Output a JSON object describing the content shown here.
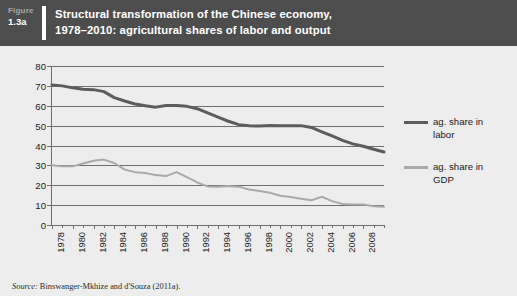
{
  "figure": {
    "label_word": "Figure",
    "label_number": "1.3a",
    "title_line1": "Structural transformation of the Chinese economy,",
    "title_line2": "1978–2010: agricultural shares of labor and output",
    "title_bar_color": "#4d4d4d",
    "panel_color": "#ededed"
  },
  "source": {
    "prefix": "Source:",
    "text": "Binswanger-Mkhize and d'Souza (2011a)."
  },
  "legend": {
    "position": "right",
    "items": [
      {
        "label_line1": "ag. share in",
        "label_line2": "labor",
        "color": "#5c5c5c"
      },
      {
        "label_line1": "ag. share in",
        "label_line2": "GDP",
        "color": "#a9a9a9"
      }
    ]
  },
  "chart_data": {
    "type": "line",
    "title": "Structural transformation of the Chinese economy, 1978–2010: agricultural shares of labor and output",
    "xlabel": "",
    "ylabel": "",
    "ylim": [
      0,
      80
    ],
    "yticks": [
      0,
      10,
      20,
      30,
      40,
      50,
      60,
      70,
      80
    ],
    "ytick_labels": [
      "0",
      "10",
      "20",
      "30",
      "40",
      "50",
      "60",
      "70",
      "80"
    ],
    "xlim": [
      1978,
      2010
    ],
    "xticks": [
      1978,
      1980,
      1982,
      1984,
      1986,
      1988,
      1990,
      1992,
      1994,
      1996,
      1998,
      2000,
      2002,
      2004,
      2006,
      2008
    ],
    "xtick_labels": [
      "1978",
      "1980",
      "1982",
      "1984",
      "1986",
      "1988",
      "1990",
      "1992",
      "1994",
      "1996",
      "1998",
      "2000",
      "2002",
      "2004",
      "2006",
      "2008"
    ],
    "xtick_labels_rotated": true,
    "grid": "horizontal",
    "legend_position": "right",
    "x": [
      1978,
      1979,
      1980,
      1981,
      1982,
      1983,
      1984,
      1985,
      1986,
      1987,
      1988,
      1989,
      1990,
      1991,
      1992,
      1993,
      1994,
      1995,
      1996,
      1997,
      1998,
      1999,
      2000,
      2001,
      2002,
      2003,
      2004,
      2005,
      2006,
      2007,
      2008,
      2009,
      2010
    ],
    "series": [
      {
        "name": "ag. share in labor",
        "color": "#5c5c5c",
        "values": [
          70.5,
          70.0,
          69.0,
          68.3,
          68.1,
          67.1,
          64.1,
          62.4,
          60.9,
          60.0,
          59.3,
          60.1,
          60.1,
          59.7,
          58.5,
          56.4,
          54.3,
          52.2,
          50.5,
          49.9,
          49.8,
          50.1,
          50.0,
          50.0,
          50.0,
          49.1,
          46.9,
          44.8,
          42.6,
          40.8,
          39.6,
          38.1,
          36.7
        ]
      },
      {
        "name": "ag. share in GDP",
        "color": "#a9a9a9",
        "values": [
          30.1,
          29.5,
          29.5,
          30.9,
          32.3,
          32.9,
          31.2,
          27.9,
          26.6,
          26.2,
          25.1,
          24.6,
          26.6,
          24.1,
          21.4,
          19.4,
          19.3,
          19.6,
          19.3,
          17.9,
          17.1,
          16.2,
          14.7,
          14.1,
          13.2,
          12.4,
          14.2,
          12.0,
          10.6,
          10.3,
          10.3,
          9.4,
          9.2
        ]
      }
    ]
  }
}
